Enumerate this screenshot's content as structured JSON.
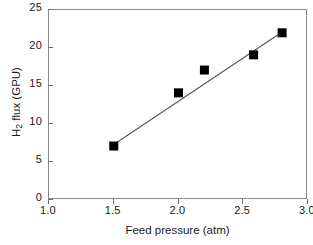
{
  "chart_data": {
    "type": "scatter",
    "title": "",
    "subtitle": "",
    "xlabel": "Feed pressure (atm)",
    "ylabel": "H2 flux (GPU)",
    "ylabel_html": "H<sub>2</sub> flux (GPU)",
    "xlim": [
      1.0,
      3.0
    ],
    "ylim": [
      0,
      25
    ],
    "xticks": [
      1.0,
      1.5,
      2.0,
      2.5,
      3.0
    ],
    "xticklabels": [
      "1.0",
      "1.5",
      "2.0",
      "2.5",
      "3.0"
    ],
    "yticks": [
      0,
      5,
      10,
      15,
      20,
      25
    ],
    "yticklabels": [
      "0",
      "5",
      "10",
      "15",
      "20",
      "25"
    ],
    "grid": false,
    "legend": null,
    "marker": "filled-square",
    "marker_color": "#000000",
    "line_color": "#555555",
    "frame_color": "#8a8a8a",
    "x": [
      1.5,
      2.0,
      2.2,
      2.58,
      2.8
    ],
    "y": [
      7.1,
      14.1,
      17.1,
      19.1,
      22.0
    ],
    "points": [
      {
        "x": 1.5,
        "y": 7.1
      },
      {
        "x": 2.0,
        "y": 14.1
      },
      {
        "x": 2.2,
        "y": 17.1
      },
      {
        "x": 2.58,
        "y": 19.1
      },
      {
        "x": 2.8,
        "y": 22.0
      }
    ],
    "fit_line": {
      "x": [
        1.5,
        2.8
      ],
      "y": [
        7.3,
        22.1
      ]
    }
  }
}
